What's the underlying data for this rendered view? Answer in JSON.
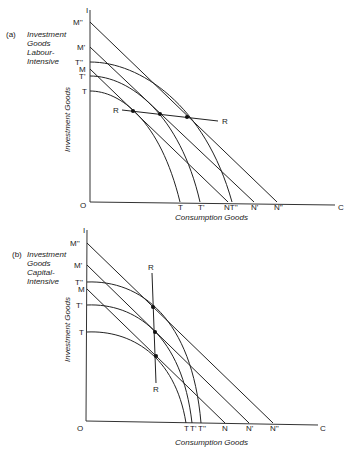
{
  "panel_a": {
    "tag": "(a)",
    "caption": [
      "Investment",
      "Goods",
      "Labour-",
      "Intensive"
    ],
    "y_axis_label": "Investment Goods",
    "x_axis_label": "Consumption Goods",
    "origin": "O",
    "y_top": "I",
    "x_end": "C",
    "y_labels": {
      "M2": "M''",
      "M1": "M'",
      "T2": "T''",
      "M0": "M",
      "T1": "T'",
      "T0": "T"
    },
    "x_labels": {
      "T0": "T",
      "T1": "T'",
      "N0T2": "NT''",
      "N1": "N'",
      "N2": "N''"
    },
    "ray_left": "R",
    "ray_right": "R"
  },
  "panel_b": {
    "tag": "(b)",
    "caption": [
      "Investment",
      "Goods",
      "Capital-",
      "Intensive"
    ],
    "y_axis_label": "Investment Goods",
    "x_axis_label": "Consumption Goods",
    "origin": "O",
    "y_top": "I",
    "x_end": "C",
    "y_labels": {
      "M2": "M''",
      "M1": "M'",
      "T2": "T''",
      "M0": "M",
      "T1": "T'",
      "T0": "T"
    },
    "x_labels": {
      "T0": "T",
      "T1": "T'",
      "T2": "T''",
      "N0": "N",
      "N1": "N'",
      "N2": "N''"
    },
    "ray_top": "R",
    "ray_bottom": "R"
  }
}
